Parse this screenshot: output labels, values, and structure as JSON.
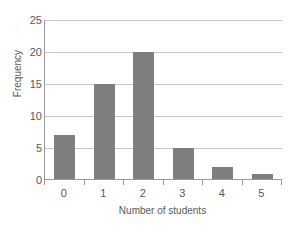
{
  "chart_data": {
    "type": "bar",
    "title": "",
    "xlabel": "Number of students",
    "ylabel": "Frequency",
    "categories": [
      "0",
      "1",
      "2",
      "3",
      "4",
      "5"
    ],
    "values": [
      7,
      15,
      20,
      5,
      2,
      1
    ],
    "ylim": [
      0,
      25
    ],
    "ytick_labels": [
      "0",
      "5",
      "10",
      "15",
      "20",
      "25"
    ],
    "ytick_values": [
      0,
      5,
      10,
      15,
      20,
      25
    ],
    "grid": "horizontal",
    "legend": "none",
    "bar_color": "#7f7f7f",
    "gridline_color": "#c8c8c8",
    "axis_color": "#9a9a9a",
    "text_color": "#595959",
    "background": "#ffffff"
  }
}
